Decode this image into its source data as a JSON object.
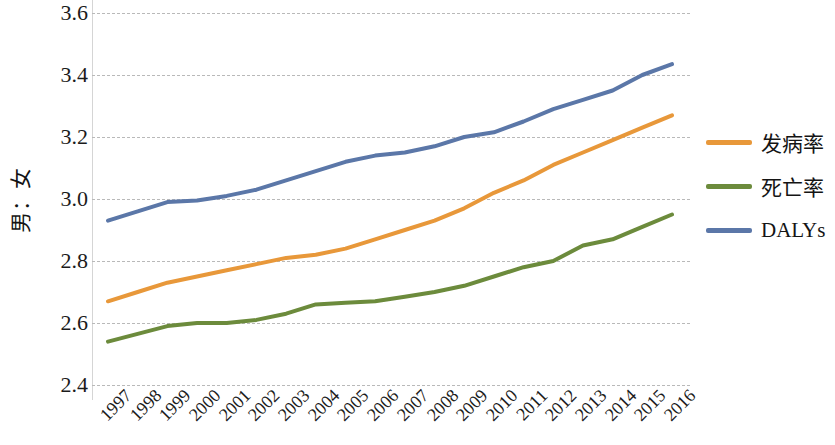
{
  "chart_data": {
    "type": "line",
    "title": "",
    "subtitle": "",
    "xlabel": "",
    "ylabel": "男：女",
    "x": [
      1997,
      1998,
      1999,
      2000,
      2001,
      2002,
      2003,
      2004,
      2005,
      2006,
      2007,
      2008,
      2009,
      2010,
      2011,
      2012,
      2013,
      2014,
      2015,
      2016
    ],
    "categories": [
      "1997",
      "1998",
      "1999",
      "2000",
      "2001",
      "2002",
      "2003",
      "2004",
      "2005",
      "2006",
      "2007",
      "2008",
      "2009",
      "2010",
      "2011",
      "2012",
      "2013",
      "2014",
      "2015",
      "2016"
    ],
    "series": [
      {
        "name": "发病率",
        "color": "#E8983A",
        "values": [
          2.67,
          2.7,
          2.73,
          2.75,
          2.77,
          2.79,
          2.81,
          2.82,
          2.84,
          2.87,
          2.9,
          2.93,
          2.97,
          3.02,
          3.06,
          3.11,
          3.15,
          3.19,
          3.23,
          3.27
        ]
      },
      {
        "name": "死亡率",
        "color": "#6C8B3C",
        "values": [
          2.54,
          2.565,
          2.59,
          2.6,
          2.6,
          2.61,
          2.63,
          2.66,
          2.665,
          2.67,
          2.685,
          2.7,
          2.72,
          2.75,
          2.78,
          2.8,
          2.85,
          2.87,
          2.91,
          2.95
        ]
      },
      {
        "name": "DALYs",
        "color": "#5B77A8",
        "values": [
          2.93,
          2.96,
          2.99,
          2.995,
          3.01,
          3.03,
          3.06,
          3.09,
          3.12,
          3.14,
          3.15,
          3.17,
          3.2,
          3.215,
          3.25,
          3.29,
          3.32,
          3.35,
          3.4,
          3.435
        ]
      }
    ],
    "y_ticks": [
      "3.6",
      "3.4",
      "3.2",
      "3.0",
      "2.8",
      "2.6",
      "2.4"
    ],
    "y_tick_values": [
      3.6,
      3.4,
      3.2,
      3.0,
      2.8,
      2.6,
      2.4
    ],
    "ylim": [
      2.4,
      3.6
    ],
    "xlim": [
      1997,
      2016
    ],
    "grid": true,
    "grid_style": "dashed",
    "grid_color": "#b9b9b9",
    "legend_position": "right",
    "legend": [
      {
        "label": "发病率",
        "color": "#E8983A"
      },
      {
        "label": "死亡率",
        "color": "#6C8B3C"
      },
      {
        "label": "DALYs",
        "color": "#5B77A8"
      }
    ],
    "background_color": "#ffffff"
  }
}
